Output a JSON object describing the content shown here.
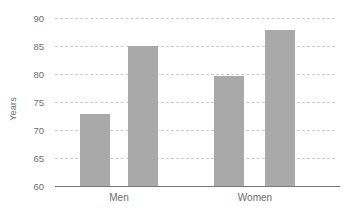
{
  "chart_data": {
    "type": "bar",
    "title": "",
    "xlabel": "",
    "ylabel": "Years",
    "ylim": [
      60,
      90
    ],
    "yticks": [
      60,
      65,
      70,
      75,
      80,
      85,
      90
    ],
    "ytick_labels": [
      "60",
      "65",
      "70",
      "75",
      "80",
      "85",
      "90"
    ],
    "grid": true,
    "legend": false,
    "categories": [
      "Men",
      "Women"
    ],
    "series": [
      {
        "name": "series-1",
        "values": [
          72.8,
          79.6
        ]
      },
      {
        "name": "series-2",
        "values": [
          85.0,
          87.8
        ]
      }
    ],
    "bars": [
      {
        "label": "Men",
        "series": "series-1",
        "value": 72.8
      },
      {
        "label": "Men",
        "series": "series-2",
        "value": 85.0
      },
      {
        "label": "Women",
        "series": "series-1",
        "value": 79.6
      },
      {
        "label": "Women",
        "series": "series-2",
        "value": 87.8
      }
    ],
    "colors": {
      "bar_fill": "#a9a9a9",
      "gridline": "#c9c9c9",
      "axis_line": "#777777",
      "tick_text": "#6e6e6e",
      "background": "#ffffff"
    }
  },
  "axes": {
    "y_title": "Years",
    "y_tick_labels": [
      "90",
      "85",
      "80",
      "75",
      "70",
      "65",
      "60"
    ],
    "x_category_labels": [
      "Men",
      "Women"
    ]
  }
}
